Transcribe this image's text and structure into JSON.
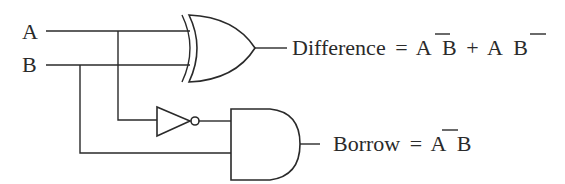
{
  "diagram": {
    "inputs": [
      {
        "label": "A"
      },
      {
        "label": "B"
      }
    ],
    "gates": [
      {
        "type": "XOR",
        "inputs": [
          "A",
          "B"
        ],
        "output": "Difference"
      },
      {
        "type": "NOT",
        "inputs": [
          "A"
        ],
        "output": "A'"
      },
      {
        "type": "AND",
        "inputs": [
          "A'",
          "B"
        ],
        "output": "Borrow"
      }
    ],
    "outputs": {
      "difference": {
        "name": "Difference",
        "eq": "=",
        "term1_a": "A",
        "term1_b": "B",
        "plus": "+",
        "term2_a": "A",
        "term2_b": "B",
        "expression": "A̅B + AB̅"
      },
      "borrow": {
        "name": "Borrow",
        "eq": "=",
        "term_a": "A",
        "term_b": "B",
        "expression": "A̅B"
      }
    },
    "colors": {
      "line": "#2a2a2a",
      "background": "#ffffff"
    }
  }
}
